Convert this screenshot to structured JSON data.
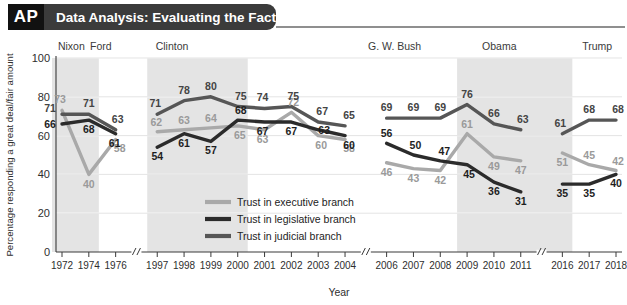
{
  "header": {
    "logo": "AP",
    "title": "Data Analysis: Evaluating the Facts"
  },
  "chart_data": {
    "type": "line",
    "title": "Data Analysis: Evaluating the Facts",
    "xlabel": "Year",
    "ylabel": "Percentage responding a great deal/fair amount",
    "ylim": [
      0,
      100
    ],
    "yticks": [
      0,
      20,
      40,
      60,
      80,
      100
    ],
    "grid": true,
    "legend_position": "inside-center-lower",
    "axis_breaks": [
      "after 1976",
      "after 2004",
      "after 2011"
    ],
    "x": [
      1972,
      1974,
      1976,
      1997,
      1998,
      1999,
      2000,
      2001,
      2002,
      2003,
      2004,
      2006,
      2007,
      2008,
      2009,
      2010,
      2011,
      2016,
      2017,
      2018
    ],
    "categories": [
      "1972",
      "1974",
      "1976",
      "1997",
      "1998",
      "1999",
      "2000",
      "2001",
      "2002",
      "2003",
      "2004",
      "2006",
      "2007",
      "2008",
      "2009",
      "2010",
      "2011",
      "2016",
      "2017",
      "2018"
    ],
    "series": [
      {
        "name": "Trust in executive branch",
        "color": "#a9a9a9",
        "values": [
          73,
          40,
          58,
          62,
          63,
          64,
          65,
          63,
          72,
          60,
          58,
          46,
          43,
          42,
          61,
          49,
          47,
          51,
          45,
          42
        ]
      },
      {
        "name": "Trust in legislative branch",
        "color": "#2b2b2b",
        "values": [
          66,
          68,
          61,
          54,
          61,
          57,
          68,
          67,
          67,
          63,
          60,
          56,
          50,
          47,
          45,
          36,
          31,
          35,
          35,
          40
        ]
      },
      {
        "name": "Trust in judicial branch",
        "color": "#565656",
        "values": [
          71,
          71,
          63,
          71,
          78,
          80,
          75,
          74,
          75,
          67,
          65,
          69,
          69,
          69,
          76,
          66,
          63,
          61,
          68,
          68
        ]
      }
    ],
    "eras": [
      {
        "label": "Nixon",
        "shaded": true,
        "from": 1972,
        "to": 1974
      },
      {
        "label": "Ford",
        "shaded": false,
        "from": 1974,
        "to": 1976
      },
      {
        "label": "Clinton",
        "shaded": true,
        "from": 1997,
        "to": 2000
      },
      {
        "label": "G. W. Bush",
        "shaded": false,
        "from": 2001,
        "to": 2009
      },
      {
        "label": "Obama",
        "shaded": true,
        "from": 2009,
        "to": 2016
      },
      {
        "label": "Trump",
        "shaded": false,
        "from": 2017,
        "to": 2018
      }
    ]
  },
  "legend": {
    "items": [
      "Trust in executive branch",
      "Trust in legislative branch",
      "Trust in judicial branch"
    ]
  }
}
